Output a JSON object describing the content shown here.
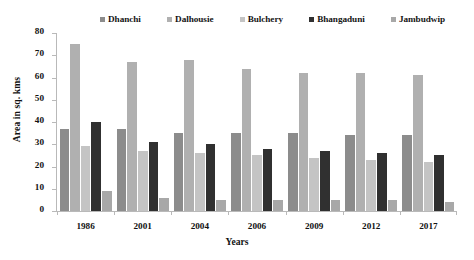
{
  "chart_data": {
    "type": "bar",
    "title": "",
    "subtitle": "",
    "xlabel": "Years",
    "ylabel": "Area in sq. kms",
    "categories": [
      "1986",
      "2001",
      "2004",
      "2006",
      "2009",
      "2012",
      "2017"
    ],
    "ylim": [
      0,
      80
    ],
    "yticks": [
      0,
      10,
      20,
      30,
      40,
      50,
      60,
      70,
      80
    ],
    "grid": false,
    "legend_position": "top",
    "series": [
      {
        "name": "Dhanchi",
        "color": "#8c8c8c",
        "values": [
          37,
          37,
          35,
          35,
          35,
          34,
          34
        ]
      },
      {
        "name": "Dalhousie",
        "color": "#b0b0b0",
        "values": [
          75,
          67,
          68,
          64,
          62,
          62,
          61
        ]
      },
      {
        "name": "Bulchery",
        "color": "#c4c4c4",
        "values": [
          29,
          27,
          26,
          25,
          24,
          23,
          22
        ]
      },
      {
        "name": "Bhangaduni",
        "color": "#303030",
        "values": [
          40,
          31,
          30,
          28,
          27,
          26,
          25
        ]
      },
      {
        "name": "Jambudwip",
        "color": "#a8a8a8",
        "values": [
          9,
          6,
          5,
          5,
          5,
          5,
          4
        ]
      }
    ]
  }
}
